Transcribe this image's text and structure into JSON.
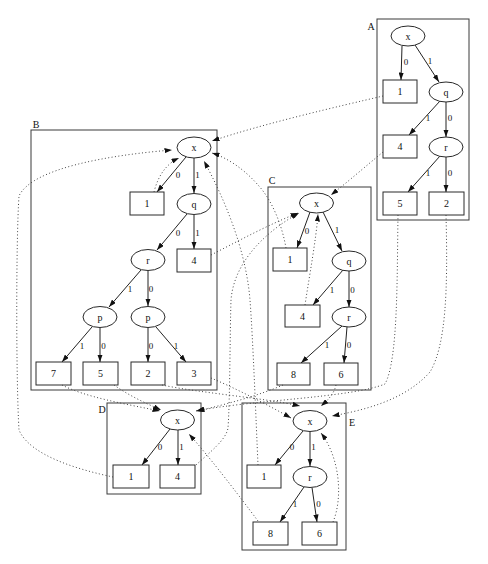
{
  "diagram": {
    "colors": {
      "background": "#ffffff",
      "stroke": "#222222"
    },
    "clusters": {
      "A": {
        "label": "A",
        "nodes": {
          "x": "x",
          "b1": "1",
          "q": "q",
          "b4": "4",
          "r": "r",
          "b5": "5",
          "b2": "2"
        },
        "edges": [
          {
            "from": "x",
            "to": "b1",
            "label": "0"
          },
          {
            "from": "x",
            "to": "q",
            "label": "1"
          },
          {
            "from": "q",
            "to": "b4",
            "label": "1"
          },
          {
            "from": "q",
            "to": "r",
            "label": "0"
          },
          {
            "from": "r",
            "to": "b5",
            "label": "1"
          },
          {
            "from": "r",
            "to": "b2",
            "label": "0"
          }
        ]
      },
      "B": {
        "label": "B",
        "nodes": {
          "x": "x",
          "b1": "1",
          "q": "q",
          "r": "r",
          "b4": "4",
          "p1": "p",
          "p0": "p",
          "b7": "7",
          "b5": "5",
          "b2": "2",
          "b3": "3"
        },
        "edges": [
          {
            "from": "x",
            "to": "b1",
            "label": "0"
          },
          {
            "from": "x",
            "to": "q",
            "label": "1"
          },
          {
            "from": "q",
            "to": "r",
            "label": "0"
          },
          {
            "from": "q",
            "to": "b4",
            "label": "1"
          },
          {
            "from": "r",
            "to": "p1",
            "label": "1"
          },
          {
            "from": "r",
            "to": "p0",
            "label": "0"
          },
          {
            "from": "p1",
            "to": "b7",
            "label": "1"
          },
          {
            "from": "p1",
            "to": "b5",
            "label": "0"
          },
          {
            "from": "p0",
            "to": "b2",
            "label": "0"
          },
          {
            "from": "p0",
            "to": "b3",
            "label": "1"
          }
        ]
      },
      "C": {
        "label": "C",
        "nodes": {
          "x": "x",
          "b1": "1",
          "q": "q",
          "b4": "4",
          "r": "r",
          "b8": "8",
          "b6": "6"
        },
        "edges": [
          {
            "from": "x",
            "to": "b1",
            "label": "0"
          },
          {
            "from": "x",
            "to": "q",
            "label": "1"
          },
          {
            "from": "q",
            "to": "b4",
            "label": "1"
          },
          {
            "from": "q",
            "to": "r",
            "label": "0"
          },
          {
            "from": "r",
            "to": "b8",
            "label": "1"
          },
          {
            "from": "r",
            "to": "b6",
            "label": "0"
          }
        ]
      },
      "D": {
        "label": "D",
        "nodes": {
          "x": "x",
          "b1": "1",
          "b4": "4"
        },
        "edges": [
          {
            "from": "x",
            "to": "b1",
            "label": "0"
          },
          {
            "from": "x",
            "to": "b4",
            "label": "1"
          }
        ]
      },
      "E": {
        "label": "E",
        "nodes": {
          "x": "x",
          "b1": "1",
          "r": "r",
          "b8": "8",
          "b6": "6"
        },
        "edges": [
          {
            "from": "x",
            "to": "b1",
            "label": "0"
          },
          {
            "from": "x",
            "to": "r",
            "label": "1"
          },
          {
            "from": "r",
            "to": "b8",
            "label": "1"
          },
          {
            "from": "r",
            "to": "b6",
            "label": "0"
          }
        ]
      }
    },
    "cross_edges": [
      {
        "from": "A.1",
        "to": "B.x",
        "style": "dotted"
      },
      {
        "from": "A.4",
        "to": "C.x",
        "style": "dotted"
      },
      {
        "from": "A.5",
        "to": "D.x",
        "style": "dotted"
      },
      {
        "from": "A.2",
        "to": "E.x",
        "style": "dotted"
      },
      {
        "from": "B.1",
        "to": "B.x",
        "style": "dotted"
      },
      {
        "from": "B.4",
        "to": "C.x",
        "style": "dotted"
      },
      {
        "from": "B.7",
        "to": "D.x",
        "style": "dotted"
      },
      {
        "from": "B.5",
        "to": "D.x",
        "style": "dotted"
      },
      {
        "from": "B.2",
        "to": "E.x",
        "style": "dotted"
      },
      {
        "from": "B.3",
        "to": "E.x",
        "style": "dotted"
      },
      {
        "from": "C.1",
        "to": "B.x",
        "style": "dotted"
      },
      {
        "from": "C.4",
        "to": "C.x",
        "style": "dotted"
      },
      {
        "from": "C.8",
        "to": "D.x",
        "style": "dotted"
      },
      {
        "from": "C.6",
        "to": "E.x",
        "style": "dotted"
      },
      {
        "from": "D.1",
        "to": "B.x",
        "style": "dotted"
      },
      {
        "from": "D.4",
        "to": "C.x",
        "style": "dotted"
      },
      {
        "from": "E.1",
        "to": "B.x",
        "style": "dotted"
      },
      {
        "from": "E.8",
        "to": "D.x",
        "style": "dotted"
      },
      {
        "from": "E.6",
        "to": "E.x",
        "style": "dotted"
      }
    ]
  }
}
